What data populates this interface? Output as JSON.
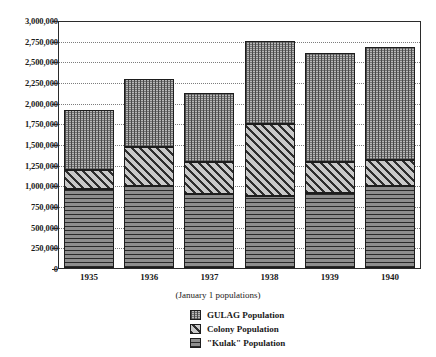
{
  "chart_data": {
    "type": "bar",
    "stacked": true,
    "title": "",
    "subtitle": "(January 1 populations)",
    "xlabel": "",
    "ylabel": "",
    "categories": [
      "1935",
      "1936",
      "1937",
      "1938",
      "1939",
      "1940"
    ],
    "ylim": [
      0,
      3000000
    ],
    "ytick_values": [
      0,
      250000,
      500000,
      750000,
      1000000,
      1250000,
      1500000,
      1750000,
      2000000,
      2250000,
      2500000,
      2750000,
      3000000
    ],
    "ytick_labels": [
      "0",
      "250,000",
      "500,000",
      "750,000",
      "1,000,000",
      "1,250,000",
      "1,500,000",
      "1,750,000",
      "2,000,000",
      "2,250,000",
      "2,500,000",
      "2,750,000",
      "3,000,000"
    ],
    "grid": true,
    "legend_position": "bottom-center",
    "series": [
      {
        "name": "\"Kulak\" Population",
        "pattern": "horizontal-lines",
        "values": [
          960000,
          1000000,
          900000,
          880000,
          920000,
          1000000
        ]
      },
      {
        "name": "Colony Population",
        "pattern": "diagonal-hatch",
        "values": [
          240000,
          480000,
          390000,
          880000,
          370000,
          320000
        ]
      },
      {
        "name": "GULAG Population",
        "pattern": "dotted-grid",
        "values": [
          730000,
          830000,
          840000,
          1010000,
          1330000,
          1380000
        ]
      }
    ],
    "totals": [
      1930000,
      2310000,
      2130000,
      2770000,
      2620000,
      2700000
    ]
  },
  "legend": {
    "items": [
      {
        "label": "GULAG Population",
        "swatch": "dotted-grid-swatch"
      },
      {
        "label": "Colony Population",
        "swatch": "diagonal-hatch-swatch"
      },
      {
        "label": "\"Kulak\" Population",
        "swatch": "horizontal-lines-swatch"
      }
    ]
  },
  "colors": {
    "gulag_fill": "#b9b9b9",
    "colony_fill": "#c9c9c9",
    "kulak_fill": "#8e8e8e",
    "axis": "#2b2b2b",
    "grid": "#7d7d7d",
    "background": "#ffffff"
  }
}
